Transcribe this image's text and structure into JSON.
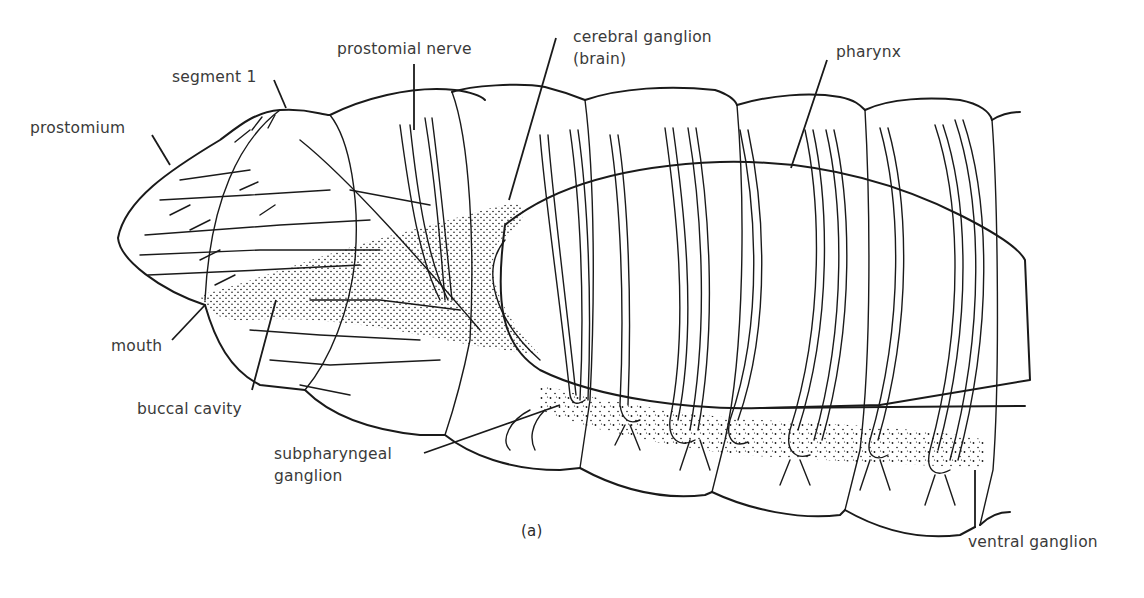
{
  "figure": {
    "caption": "(a)",
    "labels": [
      {
        "id": "segment-1",
        "text": "segment 1"
      },
      {
        "id": "prostomium",
        "text": "prostomium"
      },
      {
        "id": "prostomial-nerve",
        "text": "prostomial nerve"
      },
      {
        "id": "cerebral-ganglion",
        "text": "cerebral ganglion",
        "text2": "(brain)"
      },
      {
        "id": "pharynx",
        "text": "pharynx"
      },
      {
        "id": "mouth",
        "text": "mouth"
      },
      {
        "id": "buccal-cavity",
        "text": "buccal cavity"
      },
      {
        "id": "subpharyngeal-ganglion",
        "text": "subpharyngeal",
        "text2": "ganglion"
      },
      {
        "id": "ventral-ganglion",
        "text": "ventral ganglion"
      }
    ]
  },
  "colors": {
    "ink": "#1a1a1a",
    "label": "#3a3a3a",
    "background": "#ffffff"
  }
}
